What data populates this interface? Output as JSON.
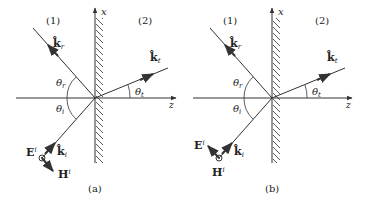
{
  "figure": {
    "panels": [
      {
        "id": "a",
        "caption": "(a)",
        "region_left": "(1)",
        "region_right": "(2)",
        "axis_x": "x",
        "axis_z": "z",
        "k_reflected": "k̂",
        "k_reflected_sub": "r",
        "k_transmitted": "k̂",
        "k_transmitted_sub": "t",
        "k_incident": "k̂",
        "k_incident_sub": "i",
        "theta_r": "θ",
        "theta_r_sub": "r",
        "theta_i": "θ",
        "theta_i_sub": "i",
        "theta_t": "θ",
        "theta_t_sub": "t",
        "E_label": "E",
        "E_sup": "i",
        "H_label": "H",
        "H_sup": "i",
        "polarization": "TE (E out of page)"
      },
      {
        "id": "b",
        "caption": "(b)",
        "region_left": "(1)",
        "region_right": "(2)",
        "axis_x": "x",
        "axis_z": "z",
        "k_reflected": "k̂",
        "k_reflected_sub": "r",
        "k_transmitted": "k̂",
        "k_transmitted_sub": "t",
        "k_incident": "k̂",
        "k_incident_sub": "i",
        "theta_r": "θ",
        "theta_r_sub": "r",
        "theta_i": "θ",
        "theta_i_sub": "i",
        "theta_t": "θ",
        "theta_t_sub": "t",
        "E_label": "E",
        "E_sup": "i",
        "H_label": "H",
        "H_sup": "i",
        "polarization": "TM (H out of page)"
      }
    ],
    "colors": {
      "stroke": "#333333",
      "text": "#222222"
    }
  }
}
